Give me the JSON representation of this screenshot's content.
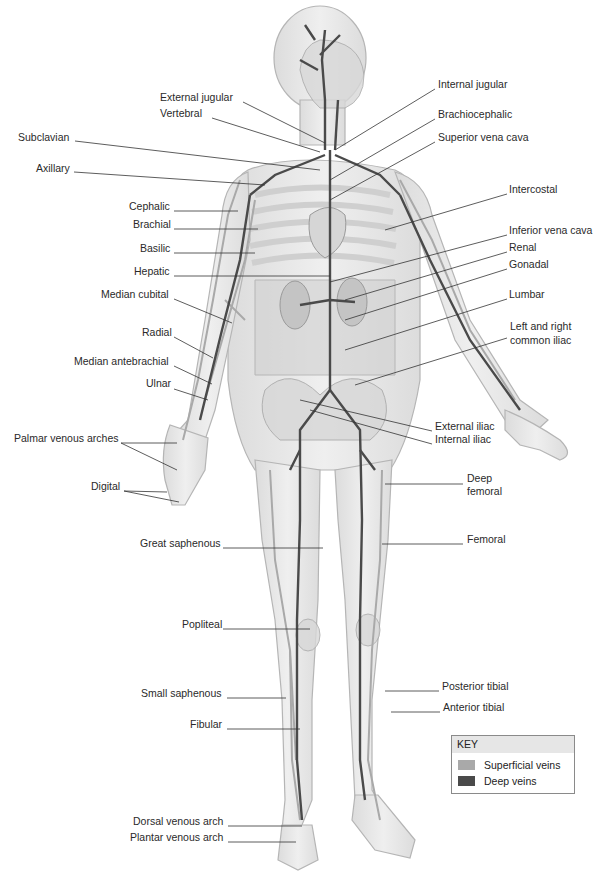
{
  "figure": {
    "colors": {
      "skin": "#e4e4e4",
      "skin_outline": "#b5b5b5",
      "bone": "#d8d8d8",
      "organ": "#c4c4c4",
      "superficial_vein": "#a9a9a9",
      "deep_vein": "#4a4a4a",
      "leader_line": "#333333"
    }
  },
  "labels_left": [
    {
      "text": "External jugular",
      "x": 160,
      "y": 97
    },
    {
      "text": "Vertebral",
      "x": 160,
      "y": 113
    },
    {
      "text": "Subclavian",
      "x": 18,
      "y": 137
    },
    {
      "text": "Axillary",
      "x": 36,
      "y": 168
    },
    {
      "text": "Cephalic",
      "x": 129,
      "y": 206
    },
    {
      "text": "Brachial",
      "x": 133,
      "y": 224
    },
    {
      "text": "Basilic",
      "x": 140,
      "y": 248
    },
    {
      "text": "Hepatic",
      "x": 134,
      "y": 271
    },
    {
      "text": "Median cubital",
      "x": 101,
      "y": 294
    },
    {
      "text": "Radial",
      "x": 142,
      "y": 332
    },
    {
      "text": "Median antebrachial",
      "x": 74,
      "y": 361
    },
    {
      "text": "Ulnar",
      "x": 146,
      "y": 383
    },
    {
      "text": "Palmar venous arches",
      "x": 14,
      "y": 438
    },
    {
      "text": "Digital",
      "x": 91,
      "y": 486
    },
    {
      "text": "Great saphenous",
      "x": 140,
      "y": 543
    },
    {
      "text": "Popliteal",
      "x": 182,
      "y": 624
    },
    {
      "text": "Small saphenous",
      "x": 141,
      "y": 693
    },
    {
      "text": "Fibular",
      "x": 190,
      "y": 724
    },
    {
      "text": "Dorsal venous arch",
      "x": 133,
      "y": 821
    },
    {
      "text": "Plantar venous arch",
      "x": 130,
      "y": 837
    }
  ],
  "labels_right": [
    {
      "text": "Internal jugular",
      "x": 438,
      "y": 84
    },
    {
      "text": "Brachiocephalic",
      "x": 438,
      "y": 114
    },
    {
      "text": "Superior vena cava",
      "x": 438,
      "y": 137
    },
    {
      "text": "Intercostal",
      "x": 509,
      "y": 189
    },
    {
      "text": "Inferior vena cava",
      "x": 509,
      "y": 230
    },
    {
      "text": "Renal",
      "x": 509,
      "y": 247
    },
    {
      "text": "Gonadal",
      "x": 509,
      "y": 264
    },
    {
      "text": "Lumbar",
      "x": 509,
      "y": 294
    },
    {
      "text": "Left and right",
      "x": 510,
      "y": 326
    },
    {
      "text": "common iliac",
      "x": 510,
      "y": 340
    },
    {
      "text": "External iliac",
      "x": 435,
      "y": 426
    },
    {
      "text": "Internal iliac",
      "x": 435,
      "y": 439
    },
    {
      "text": "Deep",
      "x": 467,
      "y": 478
    },
    {
      "text": "femoral",
      "x": 467,
      "y": 491
    },
    {
      "text": "Femoral",
      "x": 467,
      "y": 539
    },
    {
      "text": "Posterior tibial",
      "x": 442,
      "y": 686
    },
    {
      "text": "Anterior tibial",
      "x": 443,
      "y": 707
    }
  ],
  "key": {
    "title": "KEY",
    "items": [
      {
        "label": "Superficial veins",
        "color": "#a9a9a9"
      },
      {
        "label": "Deep veins",
        "color": "#4a4a4a"
      }
    ]
  }
}
